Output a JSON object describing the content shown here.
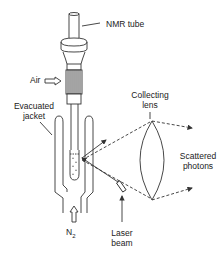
{
  "diagram": {
    "type": "raman-sample-apparatus",
    "labels": {
      "nmr_tube": "NMR tube",
      "air": "Air",
      "evacuated_jacket_1": "Evacuated",
      "evacuated_jacket_2": "jacket",
      "collecting_lens_1": "Collecting",
      "collecting_lens_2": "lens",
      "scattered_photons_1": "Scattered",
      "scattered_photons_2": "photons",
      "n2": "N",
      "n2_sub": "2",
      "laser_beam_1": "Laser",
      "laser_beam_2": "beam"
    },
    "colors": {
      "line": "#333333",
      "background": "#ffffff"
    }
  }
}
